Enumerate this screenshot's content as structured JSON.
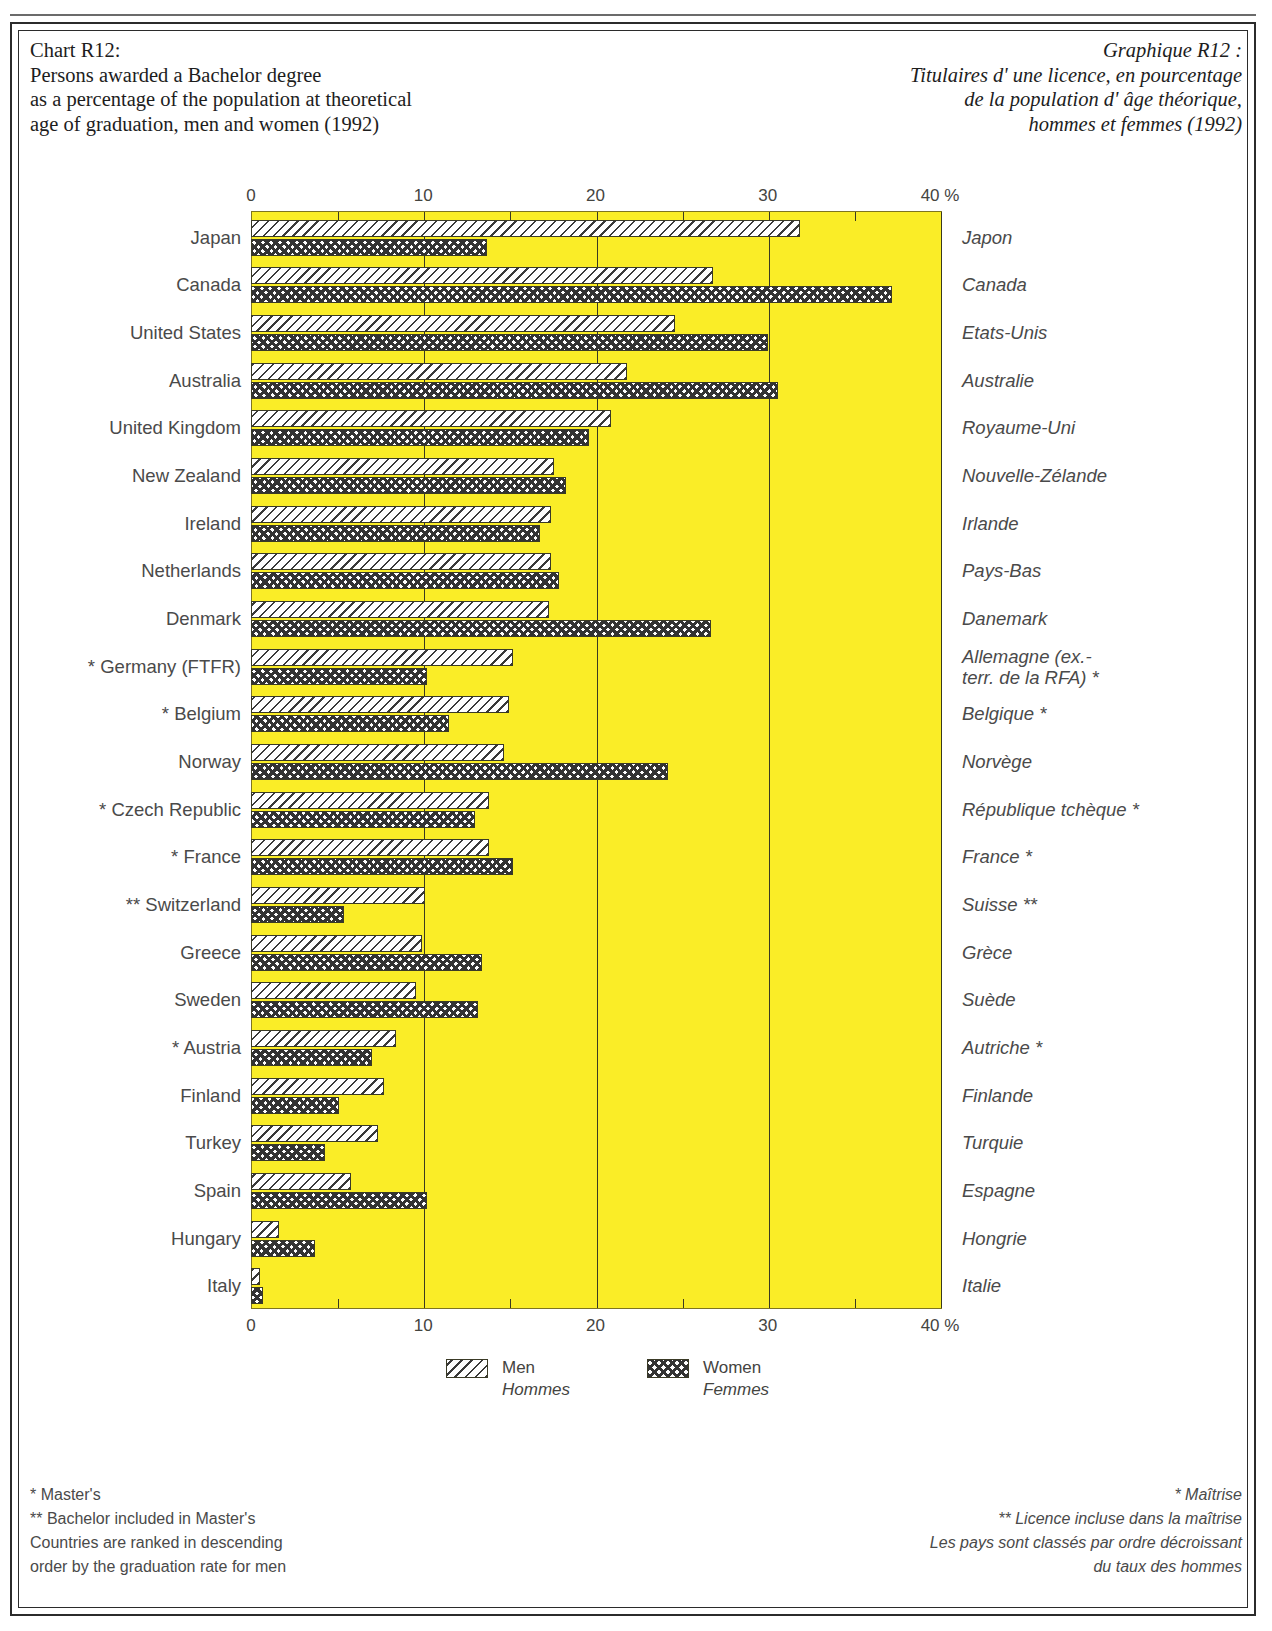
{
  "title_en": {
    "lines": [
      "Chart R12:",
      "Persons awarded a Bachelor degree",
      "as a percentage of the population at theoretical",
      "age of graduation, men and women (1992)"
    ]
  },
  "title_fr": {
    "lines": [
      "Graphique R12 :",
      "Titulaires d' une licence, en pourcentage",
      "de la population d' âge théorique,",
      "hommes et femmes (1992)"
    ]
  },
  "legend": {
    "men_en": "Men",
    "men_fr": "Hommes",
    "women_en": "Women",
    "women_fr": "Femmes"
  },
  "footnotes_en": [
    "* Master's",
    "** Bachelor included in Master's",
    "Countries are ranked in descending",
    "order by the graduation rate for men"
  ],
  "footnotes_fr": [
    "* Maîtrise",
    "** Licence incluse dans la maîtrise",
    "Les pays sont classés par ordre décroissant",
    "du taux des hommes"
  ],
  "colors": {
    "plot_background": "#faed27",
    "plot_border": "#7d7420",
    "gridline": "#3a3a20",
    "text": "#4a4a4a"
  },
  "chart_data": {
    "type": "bar",
    "orientation": "horizontal",
    "title": "Persons awarded a Bachelor degree as a percentage of the population at theoretical age of graduation, men and women (1992)",
    "xlabel": "%",
    "ylabel": "",
    "xlim": [
      0,
      40
    ],
    "xticks": [
      0,
      10,
      20,
      30,
      40
    ],
    "xticklabels": [
      "0",
      "10",
      "20",
      "30",
      "40 %"
    ],
    "xtick_unit_suffix": "%",
    "minor_tick_interval": 5,
    "grid": true,
    "legend_position": "bottom",
    "categories": [
      "Japan",
      "Canada",
      "United States",
      "Australia",
      "United Kingdom",
      "New Zealand",
      "Ireland",
      "Netherlands",
      "Denmark",
      "* Germany (FTFR)",
      "* Belgium",
      "Norway",
      "* Czech Republic",
      "* France",
      "** Switzerland",
      "Greece",
      "Sweden",
      "* Austria",
      "Finland",
      "Turkey",
      "Spain",
      "Hungary",
      "Italy"
    ],
    "categories_fr": [
      "Japon",
      "Canada",
      "Etats-Unis",
      "Australie",
      "Royaume-Uni",
      "Nouvelle-Zélande",
      "Irlande",
      "Pays-Bas",
      "Danemark",
      "Allemagne (ex.-\nterr. de la RFA) *",
      "Belgique *",
      "Norvège",
      "République tchèque *",
      "France *",
      "Suisse **",
      "Grèce",
      "Suède",
      "Autriche *",
      "Finlande",
      "Turquie",
      "Espagne",
      "Hongrie",
      "Italie"
    ],
    "series": [
      {
        "name": "Men",
        "name_fr": "Hommes",
        "pattern": "diagonal-hatch",
        "values": [
          31.9,
          26.8,
          24.6,
          21.8,
          20.9,
          17.6,
          17.4,
          17.4,
          17.3,
          15.2,
          15.0,
          14.7,
          13.8,
          13.8,
          10.1,
          9.9,
          9.6,
          8.4,
          7.7,
          7.4,
          5.8,
          1.6,
          0.5
        ]
      },
      {
        "name": "Women",
        "name_fr": "Femmes",
        "pattern": "checkerboard",
        "values": [
          13.7,
          37.2,
          30.0,
          30.6,
          19.6,
          18.3,
          16.8,
          17.9,
          26.7,
          10.2,
          11.5,
          24.2,
          13.0,
          15.2,
          5.4,
          13.4,
          13.2,
          7.0,
          5.1,
          4.3,
          10.2,
          3.7,
          0.7
        ]
      }
    ]
  }
}
